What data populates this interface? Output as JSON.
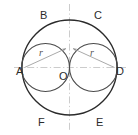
{
  "figure": {
    "width": 138,
    "height": 135,
    "background_color": "#ffffff",
    "outline_color": "#2b2b2b",
    "axis_color": "#b9b9b9",
    "leader_color": "#9a9a9a",
    "label_color": "#2b2b2b",
    "radius_label_color": "#555555"
  },
  "points": [
    {
      "id": "A",
      "label": "A",
      "x": 22,
      "y": 71,
      "desc": "left end of horizontal diameter"
    },
    {
      "id": "B",
      "label": "B",
      "x": 43,
      "y": 15,
      "desc": "upper-left arc point"
    },
    {
      "id": "C",
      "label": "C",
      "x": 97,
      "y": 15,
      "desc": "upper-right arc point"
    },
    {
      "id": "D",
      "label": "D",
      "x": 117,
      "y": 71,
      "desc": "right end of horizontal diameter"
    },
    {
      "id": "E",
      "label": "E",
      "x": 99,
      "y": 122,
      "desc": "lower-right arc point"
    },
    {
      "id": "F",
      "label": "F",
      "x": 41,
      "y": 122,
      "desc": "lower-left arc point"
    },
    {
      "id": "O",
      "label": "O",
      "x": 64,
      "y": 76,
      "desc": "center of the large circle"
    }
  ],
  "measures": [
    {
      "id": "r-left",
      "label": "r",
      "x": 40,
      "y": 52,
      "from": "A",
      "to": "intersection point above O"
    },
    {
      "id": "r-right",
      "label": "r",
      "x": 91,
      "y": 52,
      "from": "D",
      "to": "intersection point above O"
    }
  ],
  "shapes": {
    "big_circle": {
      "cx": 69.5,
      "cy": 67.5,
      "r": 47.5
    },
    "left_circle": {
      "cx": 45.5,
      "cy": 67.5,
      "r": 24.0
    },
    "right_circle": {
      "cx": 93.5,
      "cy": 67.5,
      "r": 24.0
    },
    "horizontal_axis": {
      "x1": 14,
      "y1": 67.5,
      "x2": 126,
      "y2": 67.5
    },
    "vertical_axis": {
      "x1": 69.5,
      "y1": 4,
      "x2": 69.5,
      "y2": 131
    }
  },
  "leaders": {
    "left": {
      "x1": 24.5,
      "y1": 67.5,
      "x2": 66.0,
      "y2": 48.5
    },
    "right": {
      "x1": 114.5,
      "y1": 67.5,
      "x2": 73.0,
      "y2": 48.5
    }
  }
}
